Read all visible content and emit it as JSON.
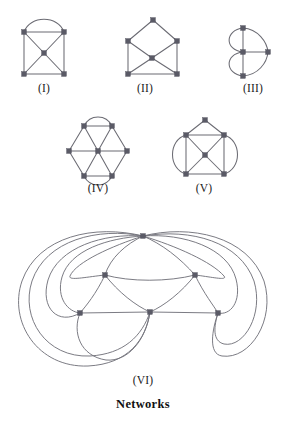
{
  "figure": {
    "title": "Networks",
    "background_color": "#ffffff",
    "edge_color": "#6b6b73",
    "vertex_color": "#5a5a66",
    "label_color": "#1a1a1a"
  },
  "panels": [
    {
      "id": "I",
      "label": "(I)",
      "label_x": 44,
      "label_y": 88,
      "description": "square with center vertex, both diagonals and an arc joining the two top corners",
      "vertex_count": 5,
      "edge_count": 9
    },
    {
      "id": "II",
      "label": "(II)",
      "label_x": 145,
      "label_y": 88,
      "description": "house shape: square with apex above, center vertex joined to the four square corners",
      "vertex_count": 6,
      "edge_count": 9
    },
    {
      "id": "III",
      "label": "(III)",
      "label_x": 253,
      "label_y": 88,
      "description": "heart shape: three collinear vertices plus right vertex with four curved arcs",
      "vertex_count": 4,
      "edge_count": 7
    },
    {
      "id": "IV",
      "label": "(IV)",
      "label_x": 98,
      "label_y": 188,
      "description": "hexagon with center vertex, three long diagonals and arcs over the top and bottom edges",
      "vertex_count": 7,
      "edge_count": 11
    },
    {
      "id": "V",
      "label": "(V)",
      "label_x": 204,
      "label_y": 188,
      "description": "house shape with center vertex plus a circle arc around the left and right sides",
      "vertex_count": 6,
      "edge_count": 11
    },
    {
      "id": "VI",
      "label": "(VI)",
      "label_x": 143,
      "label_y": 380,
      "description": "large network of six vertices joined by many long curved edges that loop around the outside",
      "vertex_count": 6,
      "edge_count": 15
    }
  ]
}
